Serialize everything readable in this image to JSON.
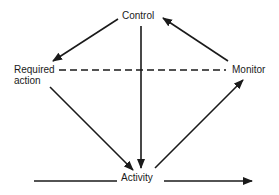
{
  "diagram": {
    "type": "control-loop",
    "nodes": {
      "control": "Control",
      "required_action_line1": "Required",
      "required_action_line2": "action",
      "monitor": "Monitor",
      "activity": "Activity"
    },
    "edges": [
      {
        "from": "Control",
        "to": "Required action",
        "style": "solid",
        "arrow": "end",
        "x1": 118,
        "y1": 19,
        "x2": 53,
        "y2": 61
      },
      {
        "from": "Monitor",
        "to": "Control",
        "style": "solid",
        "arrow": "end",
        "x1": 228,
        "y1": 61,
        "x2": 163,
        "y2": 18
      },
      {
        "from": "Control",
        "to": "Activity",
        "style": "solid",
        "arrow": "end",
        "x1": 141,
        "y1": 26,
        "x2": 141,
        "y2": 168
      },
      {
        "from": "Required action",
        "to": "Activity",
        "style": "solid",
        "arrow": "end",
        "x1": 50,
        "y1": 87,
        "x2": 133,
        "y2": 170
      },
      {
        "from": "Activity",
        "to": "Monitor",
        "style": "solid",
        "arrow": "end",
        "x1": 155,
        "y1": 168,
        "x2": 243,
        "y2": 80
      },
      {
        "from": "Required action",
        "to": "Monitor",
        "style": "dashed",
        "arrow": "none",
        "x1": 59,
        "y1": 70,
        "x2": 226,
        "y2": 70
      },
      {
        "from": "input",
        "to": "Activity",
        "style": "solid",
        "arrow": "none",
        "x1": 34,
        "y1": 181,
        "x2": 117,
        "y2": 181
      },
      {
        "from": "Activity",
        "to": "output",
        "style": "solid",
        "arrow": "end",
        "x1": 164,
        "y1": 181,
        "x2": 252,
        "y2": 181
      }
    ],
    "colors": {
      "line": "#1a1a1a",
      "background": "#ffffff"
    }
  }
}
